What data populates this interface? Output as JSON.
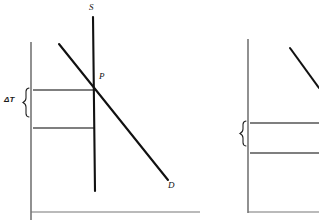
{
  "figure": {
    "type": "economics-diagram",
    "background_color": "#ffffff",
    "line_color": "#111111",
    "axis_color": "#555555"
  },
  "panels": [
    {
      "id": "left",
      "name": "inelastic-supply-panel",
      "axes": {
        "vertical_axis": {
          "x": 31,
          "y_top": 42,
          "y_bottom": 220
        },
        "horizontal_axis": {
          "y": 212,
          "x_left": 31,
          "x_right": 200
        }
      },
      "curves": [
        {
          "name": "supply-curve",
          "label": "S",
          "label_x": 89,
          "label_y": 3,
          "x1": 93,
          "y1": 17,
          "x2": 95,
          "y2": 191,
          "stroke_width": 2.1
        },
        {
          "name": "demand-curve",
          "label": "D",
          "label_x": 168,
          "label_y": 181,
          "x1": 59,
          "y1": 44,
          "x2": 168,
          "y2": 180,
          "stroke_width": 2.1
        }
      ],
      "points": [
        {
          "name": "equilibrium-point",
          "label": "P",
          "x": 94,
          "y": 80
        }
      ],
      "tax_band": {
        "label": "ΔT",
        "upper_line": {
          "y": 90,
          "x1": 33,
          "x2": 95
        },
        "lower_line": {
          "y": 128,
          "x1": 33,
          "x2": 95
        },
        "brace_x": 27,
        "brace_top": 88,
        "brace_bottom": 130,
        "label_x": 4,
        "label_y": 96
      }
    },
    {
      "id": "right",
      "name": "elastic-supply-panel",
      "axes": {
        "vertical_axis": {
          "x": 48,
          "y_top": 39,
          "y_bottom": 213
        },
        "horizontal_axis": {
          "y": 212,
          "x_left": 48,
          "x_right": 119
        }
      },
      "curves": [
        {
          "name": "demand-curve",
          "label": "",
          "x1": 90,
          "y1": 48,
          "x2": 119,
          "y2": 88,
          "stroke_width": 2.1
        }
      ],
      "points": [],
      "tax_band": {
        "label": "ΔT",
        "upper_line": {
          "y": 123,
          "x1": 50,
          "x2": 119
        },
        "lower_line": {
          "y": 153,
          "x1": 50,
          "x2": 119
        },
        "brace_x": 43,
        "brace_top": 121,
        "brace_bottom": 155,
        "label_x": 16,
        "label_y": 133
      }
    }
  ],
  "labels": {
    "supply_left": "S",
    "price_point_left": "P",
    "demand_left": "D",
    "delta_t_left": "ΔT",
    "delta_t_right": "ΔT"
  }
}
